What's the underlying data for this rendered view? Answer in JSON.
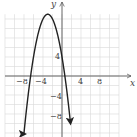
{
  "chart_data": {
    "type": "line",
    "title": "",
    "xlabel": "x",
    "ylabel": "y",
    "function": "f(x) = -x^2 - 6x + 4",
    "vertex": [
      -3,
      13
    ],
    "y_intercept": 4,
    "x_intercepts": [
      -6.61,
      0.61
    ],
    "x": [
      -8,
      -7,
      -6,
      -5,
      -4,
      -3,
      -2,
      -1,
      0,
      1,
      2
    ],
    "series": [
      {
        "name": "parabola",
        "values": [
          -12,
          -3,
          4,
          9,
          12,
          13,
          12,
          9,
          4,
          -3,
          -12
        ]
      }
    ],
    "xlim": [
      -12,
      12
    ],
    "ylim": [
      -12,
      13
    ],
    "x_ticks": [
      "-8",
      "-4",
      "4",
      "8"
    ],
    "y_ticks": [
      "4",
      "-4",
      "-8"
    ],
    "grid": true,
    "grid_step": 2,
    "legend": "none"
  },
  "labels": {
    "x_axis": "x",
    "y_axis": "y",
    "x_ticks": [
      {
        "text": "−8",
        "value": -8
      },
      {
        "text": "−4",
        "value": -4
      },
      {
        "text": "4",
        "value": 4
      },
      {
        "text": "8",
        "value": 8
      }
    ],
    "y_ticks": [
      {
        "text": "4",
        "value": 4
      },
      {
        "text": "−4",
        "value": -4
      },
      {
        "text": "−8",
        "value": -8
      }
    ]
  }
}
